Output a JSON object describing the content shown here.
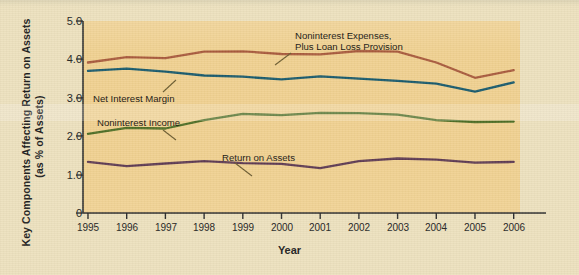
{
  "axes": {
    "y_title_line1": "Key Components Affecting Return on Assets",
    "y_title_line2": "(as % of Assets)",
    "x_title": "Year",
    "y_ticks": [
      "5.0",
      "4.0",
      "3.0",
      "2.0",
      "1.0",
      "0"
    ],
    "x_ticks": [
      "1995",
      "1996",
      "1997",
      "1998",
      "1999",
      "2000",
      "2001",
      "2002",
      "2003",
      "2004",
      "2005",
      "2006"
    ]
  },
  "annotations": {
    "noninterest_expenses_line1": "Noninterest Expenses,",
    "noninterest_expenses_line2": "Plus Loan Loss Provision",
    "net_interest_margin": "Net Interest Margin",
    "noninterest_income": "Noninterest Income",
    "return_on_assets": "Return on Assets"
  },
  "colors": {
    "background": "#ece0bd",
    "plot_background": "#f0d08f",
    "noninterest_expenses": "#a85a3c",
    "net_interest_margin": "#18596b",
    "noninterest_income": "#4d6d24",
    "return_on_assets": "#5e3b52",
    "axis": "#2b2b2b",
    "text": "#1b1b1b"
  },
  "chart_data": {
    "type": "line",
    "title": "",
    "xlabel": "Year",
    "ylabel": "Key Components Affecting Return on Assets (as % of Assets)",
    "x": [
      "1995",
      "1996",
      "1997",
      "1998",
      "1999",
      "2000",
      "2001",
      "2002",
      "2003",
      "2004",
      "2005",
      "2006"
    ],
    "ylim": [
      0,
      5.0
    ],
    "yticks": [
      0,
      1.0,
      2.0,
      3.0,
      4.0,
      5.0
    ],
    "grid": false,
    "legend": "annotations-inline",
    "series": [
      {
        "name": "Noninterest Expenses, Plus Loan Loss Provision",
        "color": "#a85a3c",
        "values": [
          3.92,
          4.06,
          4.03,
          4.2,
          4.21,
          4.14,
          4.13,
          4.22,
          4.2,
          3.92,
          3.52,
          3.72
        ]
      },
      {
        "name": "Net Interest Margin",
        "color": "#18596b",
        "values": [
          3.7,
          3.76,
          3.68,
          3.58,
          3.55,
          3.48,
          3.56,
          3.5,
          3.44,
          3.37,
          3.16,
          3.4
        ]
      },
      {
        "name": "Noninterest Income",
        "color": "#4d6d24",
        "values": [
          2.06,
          2.22,
          2.2,
          2.42,
          2.58,
          2.55,
          2.61,
          2.6,
          2.56,
          2.42,
          2.37,
          2.38
        ]
      },
      {
        "name": "Return on Assets",
        "color": "#5e3b52",
        "values": [
          1.33,
          1.22,
          1.29,
          1.35,
          1.3,
          1.28,
          1.17,
          1.35,
          1.42,
          1.39,
          1.31,
          1.33
        ]
      }
    ]
  }
}
